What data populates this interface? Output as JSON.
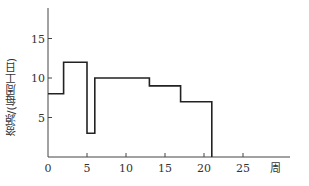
{
  "chart_data": {
    "type": "line",
    "subtype": "step",
    "title": "",
    "xlabel": "周",
    "ylabel": "资源/(每周工日)",
    "xlim": [
      0,
      30
    ],
    "ylim": [
      0,
      18
    ],
    "x_ticks": [
      0,
      5,
      10,
      15,
      20,
      25
    ],
    "y_ticks": [
      5,
      10,
      15
    ],
    "grid": false,
    "legend": null,
    "series": [
      {
        "name": "资源",
        "steps": [
          {
            "x_start": 0,
            "x_end": 2,
            "value": 8
          },
          {
            "x_start": 2,
            "x_end": 5,
            "value": 12
          },
          {
            "x_start": 5,
            "x_end": 6,
            "value": 3
          },
          {
            "x_start": 6,
            "x_end": 13,
            "value": 10
          },
          {
            "x_start": 13,
            "x_end": 17,
            "value": 9
          },
          {
            "x_start": 17,
            "x_end": 21,
            "value": 7
          }
        ]
      }
    ]
  },
  "labels": {
    "xlabel": "周",
    "ylabel": "资源/(每周工日)"
  }
}
